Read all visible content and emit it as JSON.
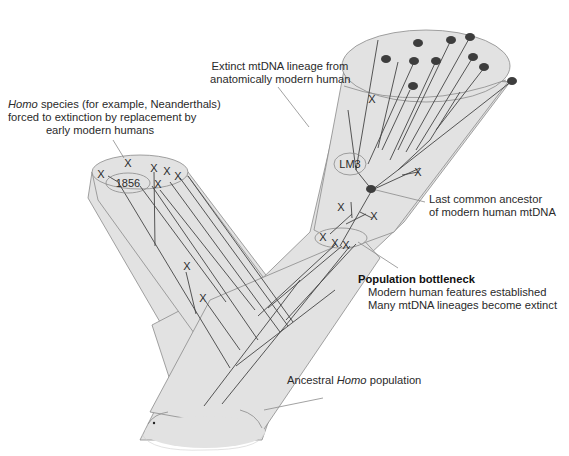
{
  "colors": {
    "population_fill": "#e2e2e2",
    "outline": "#8a8a8a",
    "lineage_line": "#444444",
    "node_fill": "#3d3d3d",
    "text": "#2a2a2a"
  },
  "labels": {
    "homo_species": {
      "italic_word": "Homo",
      "line1_rest": " species (for example, Neanderthals)",
      "line2": "forced to extinction by replacement by",
      "line3": "early modern humans"
    },
    "extinct_lineage": {
      "line1": "Extinct mtDNA lineage from",
      "line2": "anatomically modern human"
    },
    "last_common_ancestor": {
      "line1": "Last common ancestor",
      "line2": "of modern human mtDNA"
    },
    "bottleneck": {
      "title": "Population bottleneck",
      "line1": "Modern human features established",
      "line2": "Many mtDNA lineages become extinct"
    },
    "ancestral": {
      "prefix": "Ancestral ",
      "italic_word": "Homo",
      "suffix": " population"
    }
  },
  "specimens": {
    "neanderthal": "1856",
    "modern_extinct": "LM3"
  },
  "markers": {
    "extinction_symbol": "X",
    "extinct_count_neanderthal_branch": 8,
    "extinct_count_modern_branch": 7,
    "living_lineage_count": 12
  }
}
